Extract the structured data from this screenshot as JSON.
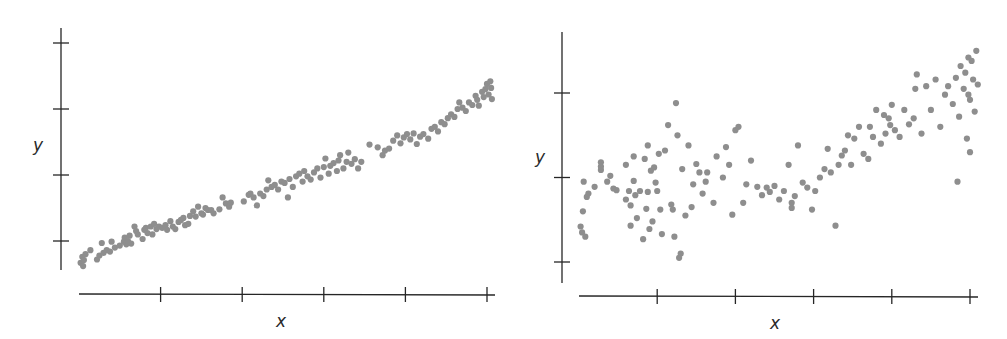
{
  "colors": {
    "point": "#8e8e8e",
    "axis": "#262626",
    "background": "#ffffff"
  },
  "chart_data": [
    {
      "type": "scatter",
      "title": "",
      "xlabel": "x",
      "ylabel": "y",
      "xlim": [
        0,
        5.1
      ],
      "ylim": [
        0.55,
        4.25
      ],
      "x_ticks": [
        1,
        2,
        3,
        4,
        5
      ],
      "y_ticks": [
        1,
        2,
        3,
        4
      ],
      "tick_labels_shown": false,
      "grid": false,
      "legend": null,
      "description": "strong positive linear relationship, low scatter",
      "layout": {
        "yaxis_px": 61,
        "yaxis_top": 28,
        "yaxis_bottom": 270,
        "xaxis_py": 294,
        "xaxis_left": 79,
        "xaxis_right": 495,
        "x0_px": 79,
        "x_unit_px": 81.6,
        "y1_py": 241,
        "y_unit_px": 66,
        "ylabel_pos": [
          38,
          151
        ],
        "xlabel_pos": [
          281,
          327
        ]
      },
      "points": [
        [
          0.02,
          0.67
        ],
        [
          0.04,
          0.76
        ],
        [
          0.05,
          0.62
        ],
        [
          0.06,
          0.71
        ],
        [
          0.08,
          0.8
        ],
        [
          0.14,
          0.86
        ],
        [
          0.22,
          0.72
        ],
        [
          0.25,
          0.78
        ],
        [
          0.28,
          0.97
        ],
        [
          0.3,
          0.82
        ],
        [
          0.34,
          0.86
        ],
        [
          0.38,
          0.84
        ],
        [
          0.4,
          0.99
        ],
        [
          0.44,
          0.9
        ],
        [
          0.5,
          0.93
        ],
        [
          0.55,
          0.99
        ],
        [
          0.56,
          1.05
        ],
        [
          0.58,
          0.95
        ],
        [
          0.6,
          1.0
        ],
        [
          0.62,
          1.08
        ],
        [
          0.64,
          0.96
        ],
        [
          0.68,
          1.22
        ],
        [
          0.7,
          1.15
        ],
        [
          0.72,
          1.1
        ],
        [
          0.78,
          1.03
        ],
        [
          0.8,
          1.17
        ],
        [
          0.82,
          1.2
        ],
        [
          0.84,
          1.12
        ],
        [
          0.88,
          1.22
        ],
        [
          0.9,
          1.1
        ],
        [
          0.92,
          1.26
        ],
        [
          0.95,
          1.18
        ],
        [
          0.98,
          1.22
        ],
        [
          1.02,
          1.2
        ],
        [
          1.06,
          1.24
        ],
        [
          1.08,
          1.17
        ],
        [
          1.12,
          1.3
        ],
        [
          1.15,
          1.22
        ],
        [
          1.18,
          1.18
        ],
        [
          1.22,
          1.29
        ],
        [
          1.25,
          1.32
        ],
        [
          1.28,
          1.35
        ],
        [
          1.3,
          1.24
        ],
        [
          1.34,
          1.26
        ],
        [
          1.36,
          1.38
        ],
        [
          1.4,
          1.45
        ],
        [
          1.43,
          1.37
        ],
        [
          1.46,
          1.52
        ],
        [
          1.5,
          1.42
        ],
        [
          1.52,
          1.4
        ],
        [
          1.55,
          1.5
        ],
        [
          1.58,
          1.47
        ],
        [
          1.62,
          1.47
        ],
        [
          1.65,
          1.42
        ],
        [
          1.72,
          1.48
        ],
        [
          1.76,
          1.66
        ],
        [
          1.8,
          1.57
        ],
        [
          1.84,
          1.52
        ],
        [
          1.86,
          1.58
        ],
        [
          2.02,
          1.6
        ],
        [
          2.08,
          1.7
        ],
        [
          2.1,
          1.72
        ],
        [
          2.14,
          1.66
        ],
        [
          2.18,
          1.54
        ],
        [
          2.22,
          1.72
        ],
        [
          2.26,
          1.68
        ],
        [
          2.3,
          1.78
        ],
        [
          2.32,
          1.92
        ],
        [
          2.36,
          1.82
        ],
        [
          2.4,
          1.85
        ],
        [
          2.44,
          1.78
        ],
        [
          2.48,
          1.9
        ],
        [
          2.52,
          1.88
        ],
        [
          2.56,
          1.66
        ],
        [
          2.58,
          1.94
        ],
        [
          2.62,
          1.82
        ],
        [
          2.66,
          1.98
        ],
        [
          2.7,
          2.02
        ],
        [
          2.74,
          1.9
        ],
        [
          2.76,
          2.06
        ],
        [
          2.8,
          1.98
        ],
        [
          2.84,
          1.93
        ],
        [
          2.88,
          2.04
        ],
        [
          2.92,
          2.1
        ],
        [
          2.96,
          1.96
        ],
        [
          3.0,
          2.12
        ],
        [
          3.02,
          2.25
        ],
        [
          3.06,
          2.02
        ],
        [
          3.08,
          2.14
        ],
        [
          3.12,
          2.18
        ],
        [
          3.16,
          2.06
        ],
        [
          3.18,
          2.22
        ],
        [
          3.2,
          2.3
        ],
        [
          3.24,
          2.1
        ],
        [
          3.28,
          2.2
        ],
        [
          3.3,
          2.34
        ],
        [
          3.34,
          2.17
        ],
        [
          3.38,
          2.24
        ],
        [
          3.42,
          2.1
        ],
        [
          3.46,
          2.2
        ],
        [
          3.56,
          2.46
        ],
        [
          3.66,
          2.42
        ],
        [
          3.72,
          2.3
        ],
        [
          3.75,
          2.37
        ],
        [
          3.8,
          2.4
        ],
        [
          3.85,
          2.52
        ],
        [
          3.9,
          2.6
        ],
        [
          3.94,
          2.48
        ],
        [
          3.98,
          2.57
        ],
        [
          4.02,
          2.62
        ],
        [
          4.06,
          2.54
        ],
        [
          4.1,
          2.63
        ],
        [
          4.14,
          2.47
        ],
        [
          4.18,
          2.58
        ],
        [
          4.22,
          2.62
        ],
        [
          4.28,
          2.55
        ],
        [
          4.32,
          2.7
        ],
        [
          4.36,
          2.73
        ],
        [
          4.4,
          2.66
        ],
        [
          4.44,
          2.8
        ],
        [
          4.48,
          2.77
        ],
        [
          4.52,
          2.86
        ],
        [
          4.56,
          2.92
        ],
        [
          4.6,
          2.88
        ],
        [
          4.64,
          3.0
        ],
        [
          4.66,
          3.1
        ],
        [
          4.7,
          3.02
        ],
        [
          4.74,
          2.97
        ],
        [
          4.78,
          3.1
        ],
        [
          4.82,
          3.06
        ],
        [
          4.86,
          3.2
        ],
        [
          4.88,
          3.14
        ],
        [
          4.9,
          3.05
        ],
        [
          4.94,
          3.26
        ],
        [
          4.96,
          3.18
        ],
        [
          4.98,
          3.3
        ],
        [
          5.0,
          3.38
        ],
        [
          5.02,
          3.22
        ],
        [
          5.04,
          3.42
        ],
        [
          5.05,
          3.32
        ],
        [
          5.06,
          3.15
        ]
      ]
    },
    {
      "type": "scatter",
      "title": "",
      "xlabel": "x",
      "ylabel": "y",
      "xlim": [
        0,
        5.1
      ],
      "ylim": [
        0.75,
        3.95
      ],
      "x_ticks": [
        1,
        2,
        3,
        4,
        5
      ],
      "y_ticks": [
        1,
        2,
        3
      ],
      "tick_labels_shown": false,
      "grid": false,
      "legend": null,
      "description": "weak positive relationship, high scatter",
      "layout": {
        "yaxis_px": 562,
        "yaxis_top": 32,
        "yaxis_bottom": 283,
        "xaxis_py": 296,
        "xaxis_left": 579,
        "xaxis_right": 978,
        "x0_px": 579,
        "x_unit_px": 78.2,
        "y1_py": 262,
        "y_unit_px": 84.5,
        "ylabel_pos": [
          540,
          163
        ],
        "xlabel_pos": [
          775,
          329
        ]
      },
      "points": [
        [
          0.02,
          1.42
        ],
        [
          0.04,
          1.35
        ],
        [
          0.05,
          1.6
        ],
        [
          0.08,
          1.3
        ],
        [
          0.06,
          1.95
        ],
        [
          0.1,
          1.77
        ],
        [
          0.12,
          1.81
        ],
        [
          0.2,
          1.89
        ],
        [
          0.28,
          2.18
        ],
        [
          0.28,
          2.09
        ],
        [
          0.28,
          2.13
        ],
        [
          0.36,
          1.95
        ],
        [
          0.4,
          2.02
        ],
        [
          0.44,
          1.87
        ],
        [
          0.48,
          1.85
        ],
        [
          0.6,
          1.74
        ],
        [
          0.6,
          2.15
        ],
        [
          0.64,
          1.84
        ],
        [
          0.66,
          1.67
        ],
        [
          0.66,
          1.43
        ],
        [
          0.7,
          1.96
        ],
        [
          0.7,
          2.25
        ],
        [
          0.72,
          1.79
        ],
        [
          0.74,
          1.52
        ],
        [
          0.78,
          1.84
        ],
        [
          0.82,
          1.27
        ],
        [
          0.84,
          2.22
        ],
        [
          0.86,
          1.63
        ],
        [
          0.88,
          1.83
        ],
        [
          0.88,
          2.38
        ],
        [
          0.9,
          1.39
        ],
        [
          0.92,
          2.08
        ],
        [
          0.94,
          1.48
        ],
        [
          0.96,
          2.12
        ],
        [
          0.98,
          1.94
        ],
        [
          1.0,
          1.84
        ],
        [
          1.02,
          2.28
        ],
        [
          1.04,
          1.62
        ],
        [
          1.06,
          1.33
        ],
        [
          1.1,
          2.32
        ],
        [
          1.14,
          2.62
        ],
        [
          1.18,
          1.68
        ],
        [
          1.2,
          1.62
        ],
        [
          1.22,
          1.3
        ],
        [
          1.24,
          2.88
        ],
        [
          1.26,
          2.5
        ],
        [
          1.28,
          1.05
        ],
        [
          1.3,
          1.1
        ],
        [
          1.32,
          2.1
        ],
        [
          1.36,
          1.55
        ],
        [
          1.4,
          2.38
        ],
        [
          1.44,
          1.65
        ],
        [
          1.46,
          1.92
        ],
        [
          1.5,
          2.16
        ],
        [
          1.54,
          2.06
        ],
        [
          1.58,
          1.81
        ],
        [
          1.62,
          1.95
        ],
        [
          1.64,
          2.06
        ],
        [
          1.72,
          1.7
        ],
        [
          1.76,
          2.25
        ],
        [
          1.84,
          2.0
        ],
        [
          1.88,
          2.36
        ],
        [
          1.92,
          2.15
        ],
        [
          1.96,
          1.56
        ],
        [
          2.0,
          2.56
        ],
        [
          2.04,
          2.6
        ],
        [
          2.1,
          1.7
        ],
        [
          2.14,
          1.92
        ],
        [
          2.2,
          2.2
        ],
        [
          2.28,
          1.89
        ],
        [
          2.34,
          1.79
        ],
        [
          2.4,
          1.88
        ],
        [
          2.44,
          1.83
        ],
        [
          2.5,
          1.9
        ],
        [
          2.56,
          1.74
        ],
        [
          2.62,
          1.84
        ],
        [
          2.68,
          2.15
        ],
        [
          2.72,
          1.64
        ],
        [
          2.72,
          1.7
        ],
        [
          2.76,
          1.78
        ],
        [
          2.8,
          2.38
        ],
        [
          2.86,
          1.94
        ],
        [
          2.92,
          1.88
        ],
        [
          2.98,
          1.62
        ],
        [
          3.02,
          1.84
        ],
        [
          3.08,
          2.0
        ],
        [
          3.14,
          2.1
        ],
        [
          3.18,
          2.34
        ],
        [
          3.22,
          2.06
        ],
        [
          3.28,
          1.43
        ],
        [
          3.32,
          2.15
        ],
        [
          3.36,
          2.26
        ],
        [
          3.4,
          2.32
        ],
        [
          3.44,
          2.5
        ],
        [
          3.48,
          2.15
        ],
        [
          3.52,
          2.46
        ],
        [
          3.58,
          2.6
        ],
        [
          3.64,
          2.28
        ],
        [
          3.7,
          2.22
        ],
        [
          3.72,
          2.6
        ],
        [
          3.76,
          2.48
        ],
        [
          3.8,
          2.8
        ],
        [
          3.86,
          2.4
        ],
        [
          3.9,
          2.74
        ],
        [
          3.96,
          2.7
        ],
        [
          4.0,
          2.86
        ],
        [
          4.04,
          2.56
        ],
        [
          4.1,
          2.48
        ],
        [
          4.16,
          2.8
        ],
        [
          4.22,
          2.63
        ],
        [
          4.28,
          2.7
        ],
        [
          4.3,
          3.05
        ],
        [
          4.32,
          3.22
        ],
        [
          4.38,
          2.52
        ],
        [
          4.44,
          3.08
        ],
        [
          4.5,
          2.8
        ],
        [
          4.56,
          3.16
        ],
        [
          4.62,
          2.6
        ],
        [
          4.68,
          2.98
        ],
        [
          4.72,
          3.08
        ],
        [
          4.78,
          2.87
        ],
        [
          4.82,
          3.18
        ],
        [
          4.86,
          2.72
        ],
        [
          4.88,
          3.32
        ],
        [
          4.92,
          3.05
        ],
        [
          4.94,
          3.24
        ],
        [
          4.96,
          2.46
        ],
        [
          4.98,
          3.42
        ],
        [
          5.0,
          2.92
        ],
        [
          5.02,
          3.38
        ],
        [
          5.04,
          3.16
        ],
        [
          5.06,
          2.78
        ],
        [
          5.08,
          3.5
        ],
        [
          5.1,
          3.1
        ],
        [
          5.0,
          2.3
        ],
        [
          4.84,
          1.95
        ],
        [
          4.98,
          2.98
        ],
        [
          3.98,
          2.62
        ],
        [
          3.92,
          2.52
        ]
      ]
    }
  ]
}
